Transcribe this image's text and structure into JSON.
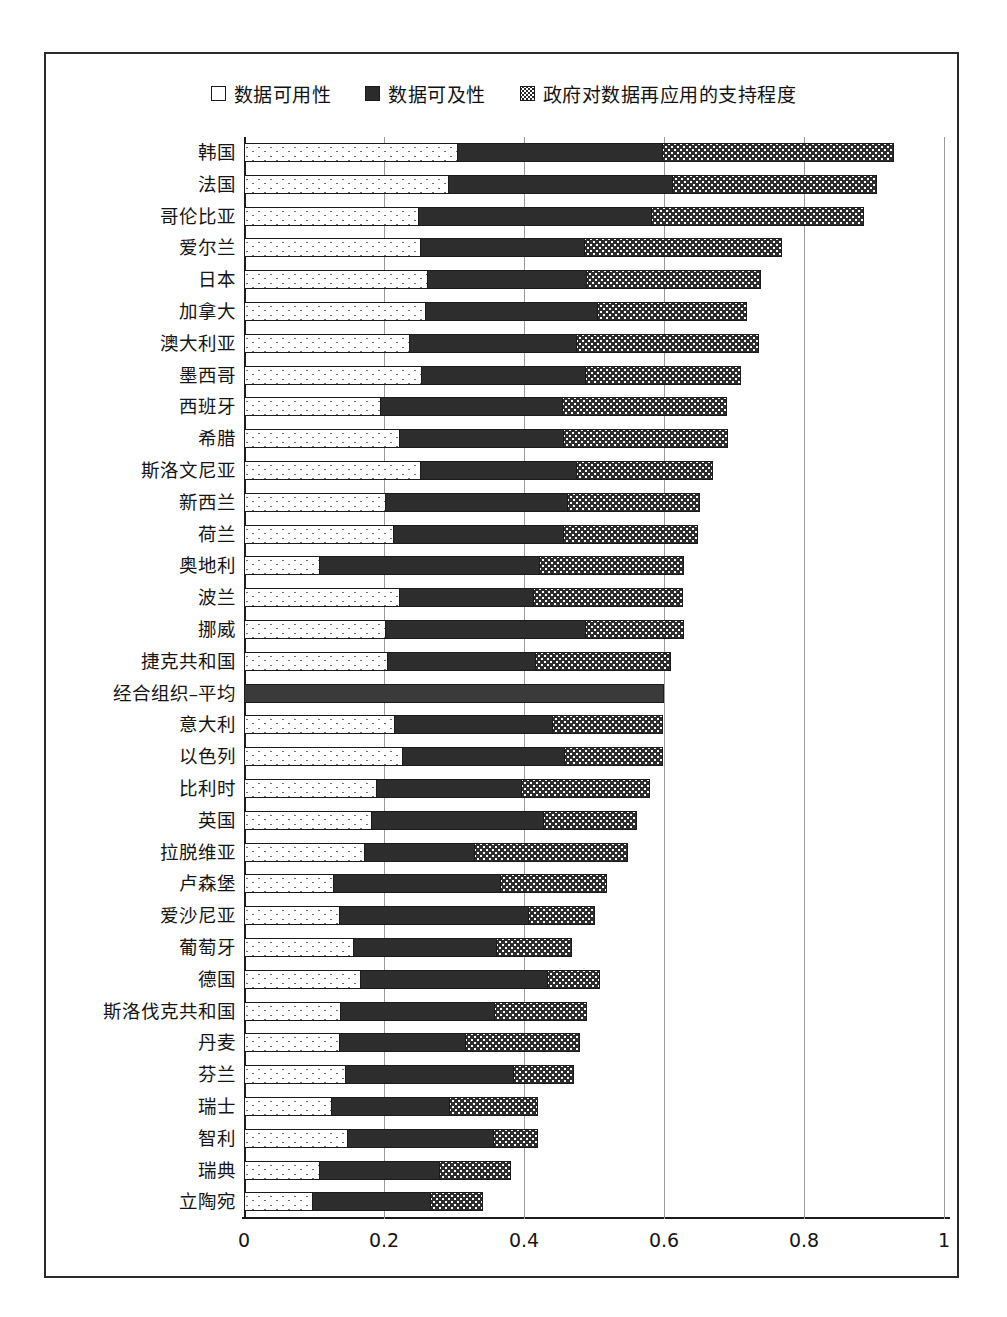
{
  "legend": {
    "items": [
      {
        "label": "数据可用性",
        "key": "availability",
        "swatch": "open-square-icon"
      },
      {
        "label": "数据可及性",
        "key": "accessibility",
        "swatch": "filled-square-icon"
      },
      {
        "label": "政府对数据再应用的支持程度",
        "key": "support",
        "swatch": "dotted-square-icon"
      }
    ]
  },
  "colors": {
    "availability": "#ffffff",
    "accessibility": "#2d2d2d",
    "support": "#2d2d2d",
    "oecd_average": "#3a3a3a",
    "axis": "#1b1b1b",
    "grid": "#9a9a9a"
  },
  "chart_data": {
    "type": "bar",
    "orientation": "horizontal",
    "stacked": true,
    "title": "",
    "xlabel": "",
    "ylabel": "",
    "xlim": [
      0,
      1
    ],
    "xticks": [
      "0",
      "0.2",
      "0.4",
      "0.6",
      "0.8",
      "1"
    ],
    "xtick_values": [
      0,
      0.2,
      0.4,
      0.6,
      0.8,
      1
    ],
    "grid": "vertical",
    "legend_position": "top",
    "categories": [
      "韩国",
      "法国",
      "哥伦比亚",
      "爱尔兰",
      "日本",
      "加拿大",
      "澳大利亚",
      "墨西哥",
      "西班牙",
      "希腊",
      "斯洛文尼亚",
      "新西兰",
      "荷兰",
      "奥地利",
      "波兰",
      "挪威",
      "捷克共和国",
      "经合组织–平均",
      "意大利",
      "以色列",
      "比利时",
      "英国",
      "拉脱维亚",
      "卢森堡",
      "爱沙尼亚",
      "葡萄牙",
      "德国",
      "斯洛伐克共和国",
      "丹麦",
      "芬兰",
      "瑞士",
      "智利",
      "瑞典",
      "立陶宛"
    ],
    "series": [
      {
        "name": "数据可用性",
        "values": [
          0.305,
          0.292,
          0.25,
          0.253,
          0.262,
          0.26,
          0.236,
          0.254,
          0.195,
          0.223,
          0.252,
          0.203,
          0.214,
          0.108,
          0.223,
          0.203,
          0.205,
          0.6,
          0.215,
          0.227,
          0.19,
          0.182,
          0.172,
          0.128,
          0.136,
          0.157,
          0.167,
          0.138,
          0.136,
          0.145,
          0.125,
          0.148,
          0.108,
          0.098
        ]
      },
      {
        "name": "数据可及性",
        "values": [
          0.294,
          0.322,
          0.333,
          0.235,
          0.229,
          0.246,
          0.24,
          0.235,
          0.261,
          0.234,
          0.224,
          0.261,
          0.243,
          0.316,
          0.192,
          0.286,
          0.213,
          0.0,
          0.227,
          0.232,
          0.208,
          0.248,
          0.158,
          0.24,
          0.272,
          0.205,
          0.269,
          0.221,
          0.181,
          0.241,
          0.17,
          0.21,
          0.172,
          0.17
        ]
      },
      {
        "name": "政府对数据再应用的支持程度",
        "values": [
          0.329,
          0.29,
          0.302,
          0.281,
          0.248,
          0.212,
          0.259,
          0.221,
          0.234,
          0.234,
          0.194,
          0.187,
          0.192,
          0.204,
          0.212,
          0.139,
          0.192,
          0.0,
          0.157,
          0.139,
          0.182,
          0.132,
          0.218,
          0.151,
          0.093,
          0.106,
          0.072,
          0.131,
          0.163,
          0.086,
          0.125,
          0.062,
          0.101,
          0.073
        ]
      }
    ],
    "totals": [
      0.928,
      0.904,
      0.885,
      0.769,
      0.739,
      0.718,
      0.735,
      0.71,
      0.69,
      0.691,
      0.67,
      0.651,
      0.649,
      0.628,
      0.627,
      0.628,
      0.61,
      0.6,
      0.599,
      0.598,
      0.58,
      0.562,
      0.548,
      0.519,
      0.501,
      0.468,
      0.508,
      0.49,
      0.48,
      0.472,
      0.42,
      0.42,
      0.381,
      0.341
    ]
  }
}
